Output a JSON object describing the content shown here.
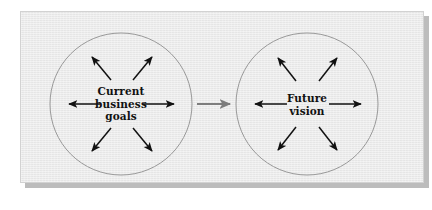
{
  "figure": {
    "type": "diagram",
    "background_color": "#ffffff",
    "panel_color": "#ececec",
    "panel_border_color": "#d2d2d2",
    "shadow_color": "#bcbcbc",
    "circle_stroke_color": "#8e8e8e",
    "arrow_color": "#111111",
    "connector_color": "#7d7d7d"
  },
  "nodes": [
    {
      "id": "current",
      "label_lines": [
        "Current",
        "business",
        "goals"
      ],
      "label_line1": "Current",
      "label_line2": "business",
      "label_line3": "goals",
      "center_x": 121,
      "center_y": 104,
      "radius": 71,
      "arrow_count": 6,
      "arrow_direction": "outward"
    },
    {
      "id": "future",
      "label_lines": [
        "Future",
        "vision"
      ],
      "label_line1": "Future",
      "label_line2": "vision",
      "center_x": 307,
      "center_y": 104,
      "radius": 71,
      "arrow_count": 6,
      "arrow_direction": "outward"
    }
  ],
  "connector": {
    "from": "current",
    "to": "future",
    "style": "single-headed arrow",
    "x_start": 197,
    "x_end": 232,
    "y": 104
  }
}
